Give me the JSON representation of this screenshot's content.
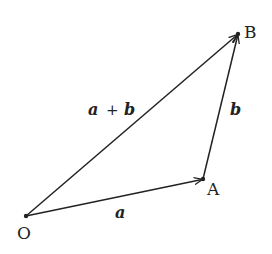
{
  "diagram": {
    "points": {
      "O": {
        "label": "O",
        "x": 26,
        "y": 216
      },
      "A": {
        "label": "A",
        "x": 203,
        "y": 179
      },
      "B": {
        "label": "B",
        "x": 238,
        "y": 34
      }
    },
    "vectors": [
      {
        "from": "O",
        "to": "A",
        "label": "a"
      },
      {
        "from": "A",
        "to": "B",
        "label": "b"
      },
      {
        "from": "O",
        "to": "B",
        "label_parts": [
          "a",
          "+",
          "b"
        ]
      }
    ],
    "labels": {
      "a": "a",
      "b": "b",
      "sum_a": "a",
      "sum_op": "+",
      "sum_b": "b"
    },
    "colors": {
      "stroke": "#222222",
      "background": "#ffffff"
    }
  }
}
